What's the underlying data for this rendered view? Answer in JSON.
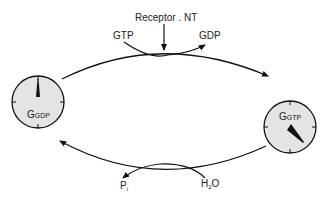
{
  "diagram": {
    "receptor_label": "Receptor . NT",
    "gtp_in_label": "GTP",
    "gdp_out_label": "GDP",
    "left_state": {
      "main": "G",
      "sub": "GDP"
    },
    "right_state": {
      "main": "G",
      "sub": "GTP"
    },
    "pi_label": {
      "main": "P",
      "sub": "i"
    },
    "water_label": {
      "main": "H",
      "sub": "2",
      "tail": "O"
    },
    "colors": {
      "dial_fill": "#e4e4e4",
      "stroke": "#111111",
      "text": "#222222"
    }
  }
}
